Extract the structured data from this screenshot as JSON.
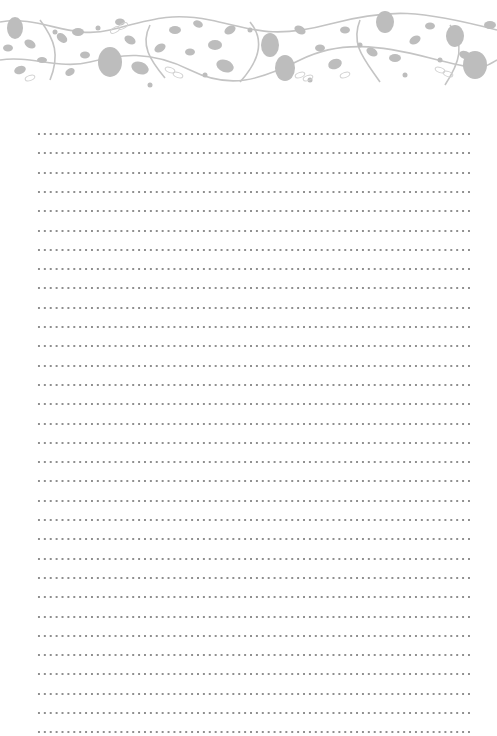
{
  "page": {
    "type": "lined-stationery",
    "background_color": "#ffffff"
  },
  "header": {
    "decoration": "floral-vine-border",
    "leaf_color": "#b8b8b8",
    "outline_color": "#d4d4d4"
  },
  "lines": {
    "style": "dotted",
    "count": 32,
    "first_y": 133,
    "spacing": 19.3,
    "left_x": 36,
    "right_x": 473,
    "dot_color": "#8f8f8f"
  }
}
